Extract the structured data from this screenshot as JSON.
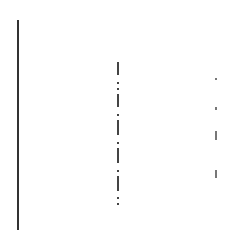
{
  "figure": {
    "left_line": {
      "x": 17,
      "y1": 20,
      "y2": 230,
      "color": "#333333"
    },
    "dashdot_line": {
      "x": 117,
      "segments": [
        {
          "type": "dash",
          "y": 62,
          "h": 13
        },
        {
          "type": "dot",
          "y": 82
        },
        {
          "type": "dot",
          "y": 88
        },
        {
          "type": "dash",
          "y": 94,
          "h": 13
        },
        {
          "type": "dot",
          "y": 114
        },
        {
          "type": "dot",
          "y": 120
        },
        {
          "type": "dash",
          "y": 122,
          "h": 13
        },
        {
          "type": "dot",
          "y": 142
        },
        {
          "type": "dot",
          "y": 148
        },
        {
          "type": "dash",
          "y": 150,
          "h": 13
        },
        {
          "type": "dot",
          "y": 170
        },
        {
          "type": "dot",
          "y": 176
        },
        {
          "type": "dash",
          "y": 178,
          "h": 13
        },
        {
          "type": "dot",
          "y": 197
        },
        {
          "type": "dot",
          "y": 203
        }
      ],
      "color": "#444444"
    },
    "right_marks": {
      "x": 215,
      "marks": [
        {
          "y": 78,
          "h": 2
        },
        {
          "y": 107,
          "h": 3
        },
        {
          "y": 131,
          "h": 9
        },
        {
          "y": 170,
          "h": 8
        }
      ],
      "color": "#777777"
    }
  }
}
